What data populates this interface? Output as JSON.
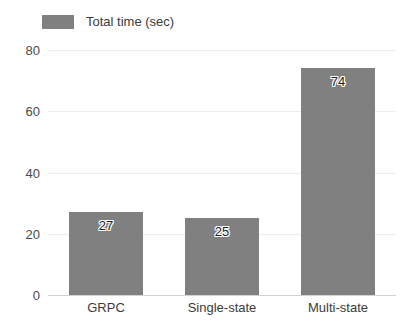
{
  "chart_data": {
    "type": "bar",
    "title": "",
    "xlabel": "",
    "ylabel": "",
    "categories": [
      "GRPC",
      "Single-state",
      "Multi-state"
    ],
    "values": [
      27,
      25,
      74
    ],
    "series": [
      {
        "name": "Total time (sec)",
        "values": [
          27,
          25,
          74
        ],
        "color": "#808080"
      }
    ],
    "ylim": [
      0,
      80
    ],
    "yticks": [
      0,
      20,
      40,
      60,
      80
    ],
    "ytick_labels": [
      "0",
      "20",
      "40",
      "60",
      "80"
    ],
    "data_labels": [
      "27",
      "25",
      "74"
    ],
    "grid": true,
    "grid_axis": "y",
    "legend": {
      "position": "top-left",
      "entries": [
        {
          "label": "Total time (sec)",
          "color": "#808080"
        }
      ]
    },
    "colors": {
      "bar": "#808080",
      "background": "#ffffff",
      "gridline": "#ececec",
      "baseline": "#d2d2d2",
      "tick_text": "#4a4a4a",
      "label_text": "#3b3b3b",
      "value_text": "#1c1c1c",
      "value_halo": "#ffffff"
    }
  }
}
